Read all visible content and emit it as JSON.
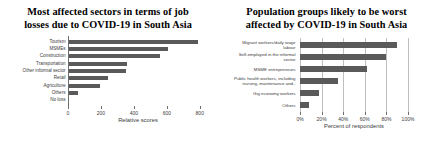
{
  "chart_data": [
    {
      "type": "bar",
      "orientation": "horizontal",
      "title": "Most affected sectors in terms of job losses due to COVID-19 in South Asia",
      "title_lines": [
        "Most affected sectors in terms of job",
        "losses due to COVID-19 in South Asia"
      ],
      "categories": [
        "Tourism",
        "MSMEs",
        "Construction",
        "Transportation",
        "Other informal sector",
        "Retail",
        "Agriculture",
        "Others",
        "No loss"
      ],
      "values": [
        790,
        610,
        560,
        360,
        355,
        240,
        195,
        60,
        0
      ],
      "xlabel": "Relative scores",
      "ylabel": "",
      "xlim": [
        0,
        850
      ],
      "xticks": [
        0,
        200,
        400,
        600,
        800
      ],
      "xticklabels": [
        "0",
        "200",
        "400",
        "600",
        "800"
      ],
      "grid": false,
      "legend": false,
      "bar_color": "#5a5a5a"
    },
    {
      "type": "bar",
      "orientation": "horizontal",
      "title": "Population groups likely to be worst affected by COVID-19 in South Asia",
      "title_lines": [
        "Population groups likely to be worst",
        "affected by COVID-19 in South Asia"
      ],
      "categories": [
        "Migrant workers/daily wage labour",
        "Self-employed in the informal sector",
        "MSME entrepreneurs",
        "Public health workers, including nursing, maintenance and..",
        "Gig economy workers",
        "Others"
      ],
      "category_lines": [
        [
          "Migrant workers/daily wage",
          "labour"
        ],
        [
          "Self-employed in the informal",
          "sector"
        ],
        [
          "MSME entrepreneurs"
        ],
        [
          "Public health workers, including",
          "nursing, maintenance and.."
        ],
        [
          "Gig economy workers"
        ],
        [
          "Others"
        ]
      ],
      "values": [
        90,
        80,
        62,
        35,
        18,
        8
      ],
      "xlabel": "Percent of respondents",
      "ylabel": "",
      "xlim": [
        0,
        100
      ],
      "xticks": [
        0,
        20,
        40,
        60,
        80,
        100
      ],
      "xticklabels": [
        "0%",
        "20%",
        "40%",
        "60%",
        "80%",
        "100%"
      ],
      "grid": true,
      "legend": false,
      "bar_color": "#5a5a5a"
    }
  ],
  "left_chart": {
    "title_line1": "Most affected sectors in terms of job",
    "title_line2": "losses due to COVID-19 in South Asia",
    "xlabel": "Relative scores",
    "categories": [
      "Tourism",
      "MSMEs",
      "Construction",
      "Transportation",
      "Other informal sector",
      "Retail",
      "Agriculture",
      "Others",
      "No loss"
    ],
    "xticklabels": [
      "0",
      "200",
      "400",
      "600",
      "800"
    ]
  },
  "right_chart": {
    "title_line1": "Population groups likely to be worst",
    "title_line2": "affected by COVID-19 in South Asia",
    "xlabel": "Percent of respondents",
    "cat0_l1": "Migrant workers/daily wage",
    "cat0_l2": "labour",
    "cat1_l1": "Self-employed in the informal",
    "cat1_l2": "sector",
    "cat2_l1": "MSME entrepreneurs",
    "cat3_l1": "Public health workers, including",
    "cat3_l2": "nursing, maintenance and..",
    "cat4_l1": "Gig economy workers",
    "cat5_l1": "Others",
    "xticklabels": [
      "0%",
      "20%",
      "40%",
      "60%",
      "80%",
      "100%"
    ]
  }
}
